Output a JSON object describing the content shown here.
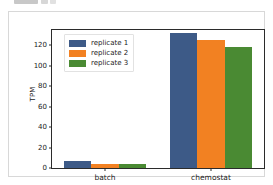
{
  "chart_data": {
    "type": "bar",
    "title": "",
    "subtitle": "",
    "xlabel": "",
    "ylabel": "TPM",
    "categories": [
      "batch",
      "chemostat"
    ],
    "series": [
      {
        "name": "replicate 1",
        "color": "#3d5a87",
        "values": [
          7,
          132
        ]
      },
      {
        "name": "replicate 2",
        "color": "#f28122",
        "values": [
          4,
          125
        ]
      },
      {
        "name": "replicate 3",
        "color": "#4a8a33",
        "values": [
          4,
          118
        ]
      }
    ],
    "ylim": [
      0,
      135
    ],
    "yticks": [
      0,
      20,
      40,
      60,
      80,
      100,
      120
    ],
    "ytick_labels": [
      "0",
      "20",
      "40",
      "60",
      "80",
      "100",
      "120"
    ],
    "xtick_labels": [
      "batch",
      "chemostat"
    ],
    "grid": false,
    "legend_position": "upper left",
    "legend_entries": [
      "replicate 1",
      "replicate 2",
      "replicate 3"
    ]
  },
  "figure": {
    "background_color": "#ffffff",
    "frame_color": "#d8d8d8",
    "axes_edge_color": "#2b2b2b"
  }
}
